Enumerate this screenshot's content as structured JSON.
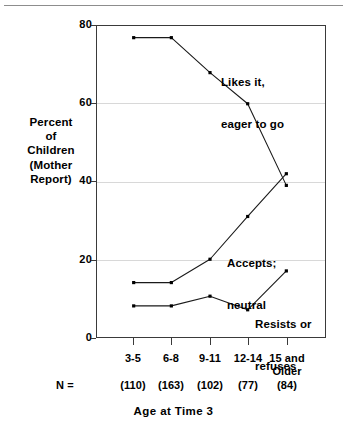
{
  "chart_data": {
    "type": "line",
    "title": "",
    "xlabel": "Age at Time 3",
    "ylabel": "Percent of Children (Mother Report)",
    "ylabel_lines": [
      "Percent",
      "of",
      "Children",
      "(Mother",
      "Report)"
    ],
    "categories": [
      "3-5",
      "6-8",
      "9-11",
      "12-14",
      "15 and Older"
    ],
    "category_lines": [
      [
        "3-5"
      ],
      [
        "6-8"
      ],
      [
        "9-11"
      ],
      [
        "12-14"
      ],
      [
        "15 and",
        "Older"
      ]
    ],
    "n_caption": "N =",
    "n_values": [
      "(110)",
      "(163)",
      "(102)",
      "(77)",
      "(84)"
    ],
    "ylim": [
      0,
      80
    ],
    "yticks": [
      0,
      20,
      40,
      60,
      80
    ],
    "ytick_labels": [
      "0",
      "20",
      "40",
      "60",
      "80"
    ],
    "grid": true,
    "grid_axis": "y",
    "legend": "annotations",
    "series": [
      {
        "name": "Likes it, eager to go",
        "label_lines": [
          "Likes it,",
          "eager to go"
        ],
        "values": [
          77,
          77,
          68,
          60,
          39
        ]
      },
      {
        "name": "Accepts; neutral",
        "label_lines": [
          "Accepts;",
          "neutral"
        ],
        "values": [
          14,
          14,
          20,
          31,
          42
        ]
      },
      {
        "name": "Resists or refuses",
        "label_lines": [
          "Resists or",
          "refuses"
        ],
        "values": [
          8,
          8,
          10.5,
          7,
          17
        ]
      }
    ],
    "colors": {
      "line": "#1a1a1a",
      "marker": "#000000",
      "grid": "#d8d8d8",
      "axis": "#3a3a3a",
      "background": "#ffffff"
    }
  }
}
